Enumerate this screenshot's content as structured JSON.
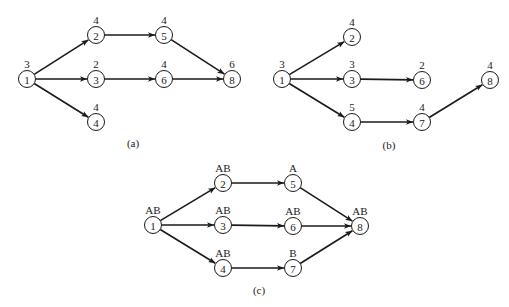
{
  "diagrams": [
    {
      "id": "a",
      "caption": "(a)",
      "caption_pos": [
        133,
        147
      ],
      "nodes": [
        {
          "id": "1",
          "label": "3",
          "x": 27,
          "y": 79
        },
        {
          "id": "2",
          "label": "4",
          "x": 96,
          "y": 35
        },
        {
          "id": "3",
          "label": "2",
          "x": 96,
          "y": 79
        },
        {
          "id": "4",
          "label": "4",
          "x": 96,
          "y": 122
        },
        {
          "id": "5",
          "label": "4",
          "x": 164,
          "y": 35
        },
        {
          "id": "6",
          "label": "4",
          "x": 164,
          "y": 79
        },
        {
          "id": "8",
          "label": "6",
          "x": 232,
          "y": 79
        }
      ],
      "edges": [
        [
          "1",
          "2"
        ],
        [
          "1",
          "3"
        ],
        [
          "1",
          "4"
        ],
        [
          "2",
          "5"
        ],
        [
          "3",
          "6"
        ],
        [
          "5",
          "8"
        ],
        [
          "6",
          "8"
        ]
      ]
    },
    {
      "id": "b",
      "caption": "(b)",
      "caption_pos": [
        389,
        149
      ],
      "nodes": [
        {
          "id": "1",
          "label": "3",
          "x": 282,
          "y": 79
        },
        {
          "id": "2",
          "label": "4",
          "x": 352,
          "y": 37
        },
        {
          "id": "3",
          "label": "3",
          "x": 352,
          "y": 79
        },
        {
          "id": "4",
          "label": "5",
          "x": 352,
          "y": 122
        },
        {
          "id": "6",
          "label": "2",
          "x": 422,
          "y": 80
        },
        {
          "id": "7",
          "label": "4",
          "x": 422,
          "y": 122
        },
        {
          "id": "8",
          "label": "4",
          "x": 490,
          "y": 80
        }
      ],
      "edges": [
        [
          "1",
          "2"
        ],
        [
          "1",
          "3"
        ],
        [
          "1",
          "4"
        ],
        [
          "3",
          "6"
        ],
        [
          "4",
          "7"
        ],
        [
          "7",
          "8"
        ]
      ]
    },
    {
      "id": "c",
      "caption": "(c)",
      "caption_pos": [
        259,
        294
      ],
      "nodes": [
        {
          "id": "1",
          "label": "AB",
          "x": 153,
          "y": 225
        },
        {
          "id": "2",
          "label": "AB",
          "x": 223,
          "y": 183
        },
        {
          "id": "3",
          "label": "AB",
          "x": 223,
          "y": 225
        },
        {
          "id": "4",
          "label": "AB",
          "x": 223,
          "y": 268
        },
        {
          "id": "5",
          "label": "A",
          "x": 293,
          "y": 183
        },
        {
          "id": "6",
          "label": "AB",
          "x": 293,
          "y": 226
        },
        {
          "id": "7",
          "label": "B",
          "x": 293,
          "y": 268
        },
        {
          "id": "8",
          "label": "AB",
          "x": 360,
          "y": 226
        }
      ],
      "edges": [
        [
          "1",
          "2"
        ],
        [
          "1",
          "3"
        ],
        [
          "1",
          "4"
        ],
        [
          "2",
          "5"
        ],
        [
          "3",
          "6"
        ],
        [
          "4",
          "7"
        ],
        [
          "5",
          "8"
        ],
        [
          "6",
          "8"
        ],
        [
          "7",
          "8"
        ]
      ]
    }
  ],
  "style": {
    "node_radius": 8.5,
    "stroke_color": "#1a1a1a",
    "background": "#ffffff"
  }
}
